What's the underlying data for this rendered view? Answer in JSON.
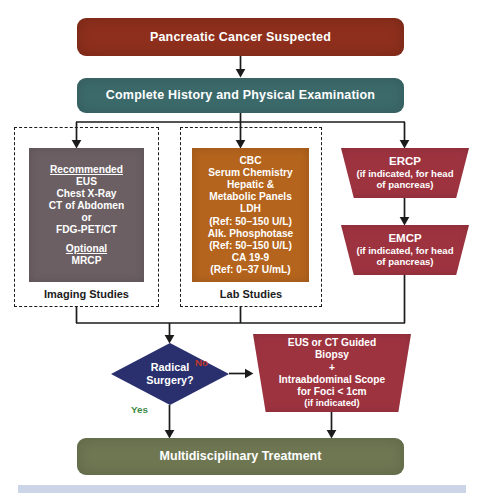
{
  "diagram": {
    "title": "Pancreatic Cancer Suspected",
    "type": "flowchart",
    "nodes": {
      "suspected": {
        "label": "Pancreatic Cancer Suspected",
        "shape": "rounded-rect",
        "color": "#8e2f1d"
      },
      "history": {
        "label": "Complete History and Physical Examination",
        "shape": "rounded-rect",
        "color": "#3c6a6b"
      },
      "imaging": {
        "shape": "rect",
        "color": "#6b5f64",
        "heading_recommended": "Recommended",
        "recommended": [
          "EUS",
          "Chest X-Ray",
          "CT of Abdomen",
          "or",
          "FDG-PET/CT"
        ],
        "heading_optional": "Optional",
        "optional": [
          "MRCP"
        ]
      },
      "lab": {
        "shape": "rect",
        "color": "#b4641d",
        "lines": [
          "CBC",
          "Serum Chemistry",
          "Hepatic &",
          "Metabolic Panels",
          "LDH",
          "(Ref: 50–150 U/L)",
          "Alk. Phosphotase",
          "(Ref: 50–150 U/L)",
          "CA 19-9",
          "(Ref: 0–37 U/mL)"
        ]
      },
      "ercp": {
        "title": "ERCP",
        "shape": "trapezoid",
        "color": "#9e3340",
        "sub_line1": "(if indicated, for head",
        "sub_line2": "of pancreas)"
      },
      "emcp": {
        "title": "EMCP",
        "shape": "trapezoid",
        "color": "#9e3340",
        "sub_line1": "(if indicated, for head",
        "sub_line2": "of pancreas)"
      },
      "decision": {
        "line1": "Radical",
        "line2": "Surgery?",
        "shape": "diamond",
        "color": "#2a2f6e"
      },
      "biopsy": {
        "shape": "trapezoid",
        "color": "#9e3340",
        "lines": [
          "EUS or CT Guided",
          "Biopsy",
          "+",
          "Intraabdominal Scope",
          "for Foci < 1cm"
        ],
        "note": "(if indicated)"
      },
      "treatment": {
        "label": "Multidisciplinary Treatment",
        "shape": "rounded-rect",
        "color": "#6e7752"
      }
    },
    "groups": {
      "imaging_label": "Imaging Studies",
      "lab_label": "Lab Studies"
    },
    "edge_labels": {
      "no": "No",
      "yes": "Yes"
    },
    "edge_label_colors": {
      "no": "#c0392b",
      "yes": "#3c8a45"
    }
  }
}
